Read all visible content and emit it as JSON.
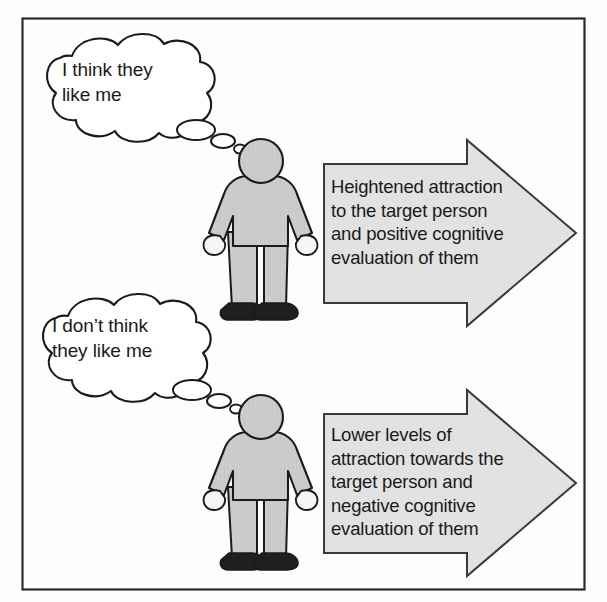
{
  "figure": {
    "frame": {
      "border_color": "#2b2b2b",
      "background_color": "#fdfdfd"
    },
    "colors": {
      "outline": "#1a1a1a",
      "body_fill": "#c9c9c9",
      "hand_fill": "#f2f2f2",
      "shoe_fill": "#1f1f1f",
      "arrow_fill": "#e2e2e2",
      "bubble_fill": "#ffffff",
      "text_color": "#1a1a1a"
    }
  },
  "branches": [
    {
      "id": "positive",
      "thought_bubble": {
        "name": "thought-bubble-positive",
        "text": "I think they\nlike me"
      },
      "person": {
        "name": "person-figure-positive",
        "label": "stick person standing"
      },
      "arrow": {
        "name": "outcome-arrow-positive",
        "direction": "right",
        "text": "Heightened attraction\nto the target person\nand positive cognitive\nevaluation of them"
      }
    },
    {
      "id": "negative",
      "thought_bubble": {
        "name": "thought-bubble-negative",
        "text": "I don’t think\nthey like me"
      },
      "person": {
        "name": "person-figure-negative",
        "label": "stick person standing"
      },
      "arrow": {
        "name": "outcome-arrow-negative",
        "direction": "right",
        "text": "Lower levels of\nattraction towards the\ntarget person and\nnegative cognitive\nevaluation of them"
      }
    }
  ]
}
